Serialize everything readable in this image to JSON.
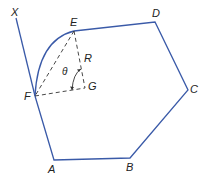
{
  "diagram": {
    "colors": {
      "polygon": "#3a5aa8",
      "construction": "#333333",
      "text": "#222222"
    },
    "labels": {
      "X": "X",
      "E": "E",
      "D": "D",
      "C": "C",
      "B": "B",
      "A": "A",
      "F": "F",
      "G": "G",
      "R": "R",
      "theta": "θ"
    },
    "points": {
      "X": [
        16,
        18
      ],
      "E": [
        74,
        31
      ],
      "D": [
        155,
        22
      ],
      "C": [
        188,
        90
      ],
      "B": [
        130,
        158
      ],
      "A": [
        54,
        160
      ],
      "F": [
        35,
        96
      ],
      "G": [
        85,
        88
      ]
    }
  }
}
